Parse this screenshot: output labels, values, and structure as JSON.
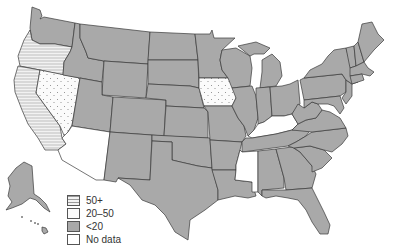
{
  "colors": {
    "fill_under20": "#a9a9a9",
    "fill_white": "#ffffff",
    "border": "#3a3a3a"
  },
  "legend": {
    "items": [
      {
        "label": "50+",
        "pattern": "horizontal-lines"
      },
      {
        "label": "20–50",
        "pattern": "dots"
      },
      {
        "label": "<20",
        "pattern": "solid-gray"
      },
      {
        "label": "No data",
        "pattern": "white"
      }
    ]
  },
  "categories": {
    "50+": [
      "Oregon",
      "California"
    ],
    "20–50": [
      "Nevada",
      "Iowa"
    ],
    "<20": [
      "Washington",
      "Idaho",
      "Montana",
      "Wyoming",
      "Utah",
      "Colorado",
      "New Mexico",
      "Texas",
      "Oklahoma",
      "Kansas",
      "Nebraska",
      "South Dakota",
      "North Dakota",
      "Minnesota",
      "Wisconsin",
      "Michigan",
      "Illinois",
      "Indiana",
      "Ohio",
      "Missouri",
      "Arkansas",
      "Louisiana",
      "Alabama",
      "Georgia",
      "Florida",
      "South Carolina",
      "North Carolina",
      "Tennessee",
      "Virginia",
      "West Virginia",
      "Pennsylvania",
      "New York",
      "Vermont",
      "New Hampshire",
      "Maine",
      "Massachusetts",
      "Connecticut",
      "Rhode Island",
      "New Jersey",
      "Delaware",
      "Maryland",
      "Alaska",
      "Hawaii"
    ],
    "No data": [
      "Arizona",
      "Kentucky",
      "Mississippi"
    ]
  }
}
